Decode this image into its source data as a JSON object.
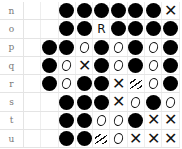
{
  "board": {
    "rows": [
      {
        "label": "n",
        "cells": [
          "",
          "",
          "",
          "stone",
          "stone",
          "stone",
          "stone",
          "stone",
          "stone",
          "x"
        ]
      },
      {
        "label": "o",
        "cells": [
          "",
          "",
          "",
          "stone",
          "stone",
          "r",
          "stone",
          "stone",
          "stone",
          "stone"
        ]
      },
      {
        "label": "p",
        "cells": [
          "",
          "",
          "stone",
          "stone",
          "o",
          "stone",
          "o",
          "stone",
          "o",
          "stone"
        ]
      },
      {
        "label": "q",
        "cells": [
          "",
          "",
          "stone",
          "o",
          "x",
          "stone",
          "o",
          "stone",
          "o",
          "stone"
        ]
      },
      {
        "label": "r",
        "cells": [
          "",
          "",
          "stone",
          "o",
          "stone",
          "stone",
          "x",
          "hatch",
          "o",
          "stone"
        ]
      },
      {
        "label": "s",
        "cells": [
          "",
          "",
          "",
          "stone",
          "stone",
          "stone",
          "x",
          "o",
          "stone",
          "o"
        ]
      },
      {
        "label": "t",
        "cells": [
          "",
          "",
          "",
          "stone",
          "stone",
          "o",
          "o",
          "stone",
          "x",
          "x"
        ]
      },
      {
        "label": "u",
        "cells": [
          "",
          "",
          "",
          "stone",
          "stone",
          "hatch",
          "o",
          "x",
          "x",
          "x"
        ]
      }
    ],
    "glyphs": {
      "x": "✕",
      "r": "R"
    }
  }
}
